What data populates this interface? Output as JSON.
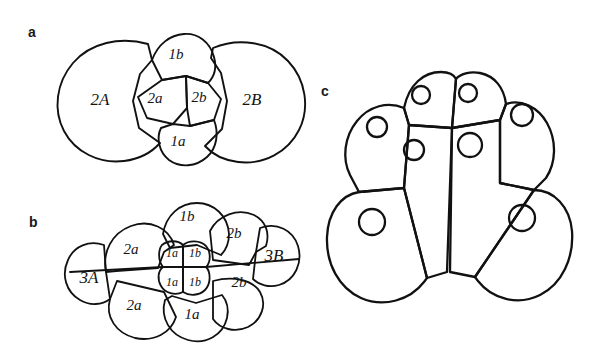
{
  "figure": {
    "background_color": "#ffffff",
    "ink_color": "#111111",
    "panels": [
      {
        "id": "a",
        "label": "a",
        "label_pos": [
          32,
          32
        ],
        "description": "four-cell stage, two large macromeres and four central micromeres",
        "cells": [
          {
            "name": "2A",
            "label": "2A",
            "x": 100,
            "y": 99,
            "size": "lbl-lg"
          },
          {
            "name": "1b",
            "label": "1b",
            "x": 176,
            "y": 54,
            "size": "lbl-md"
          },
          {
            "name": "2a",
            "label": "2a",
            "x": 155,
            "y": 98,
            "size": "lbl-md"
          },
          {
            "name": "2b",
            "label": "2b",
            "x": 199,
            "y": 97,
            "size": "lbl-md"
          },
          {
            "name": "1a",
            "label": "1a",
            "x": 178,
            "y": 141,
            "size": "lbl-md"
          },
          {
            "name": "2B",
            "label": "2B",
            "x": 252,
            "y": 99,
            "size": "lbl-lg"
          }
        ]
      },
      {
        "id": "b",
        "label": "b",
        "label_pos": [
          33,
          222
        ],
        "description": "later stage with eight peripheral cells and four central micromeres",
        "cells": [
          {
            "name": "3A",
            "label": "3A",
            "x": 89,
            "y": 277,
            "size": "lbl-lg"
          },
          {
            "name": "2a-upper",
            "label": "2a",
            "x": 131,
            "y": 249,
            "size": "lbl-md"
          },
          {
            "name": "2a-lower",
            "label": "2a",
            "x": 134,
            "y": 305,
            "size": "lbl-md"
          },
          {
            "name": "1b-top",
            "label": "1b",
            "x": 187,
            "y": 216,
            "size": "lbl-md"
          },
          {
            "name": "1a-center-upper",
            "label": "1a",
            "x": 172,
            "y": 253,
            "size": "lbl-sm"
          },
          {
            "name": "1b-center-upper",
            "label": "1b",
            "x": 195,
            "y": 253,
            "size": "lbl-sm"
          },
          {
            "name": "1a-center-lower",
            "label": "1a",
            "x": 172,
            "y": 282,
            "size": "lbl-sm"
          },
          {
            "name": "1b-center-lower",
            "label": "1b",
            "x": 195,
            "y": 282,
            "size": "lbl-sm"
          },
          {
            "name": "2b-upper",
            "label": "2b",
            "x": 234,
            "y": 233,
            "size": "lbl-md"
          },
          {
            "name": "2b-lower",
            "label": "2b",
            "x": 239,
            "y": 282,
            "size": "lbl-md"
          },
          {
            "name": "3B",
            "label": "3B",
            "x": 274,
            "y": 255,
            "size": "lbl-lg"
          },
          {
            "name": "1a-bottom",
            "label": "1a",
            "x": 192,
            "y": 314,
            "size": "lbl-md"
          }
        ]
      },
      {
        "id": "c",
        "label": "c",
        "label_pos": [
          325,
          91
        ],
        "description": "sectioned embryo with eight cells each containing a single round nucleus",
        "cells": [],
        "nuclei_count": 8
      }
    ]
  }
}
